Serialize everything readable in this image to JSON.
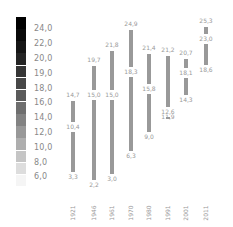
{
  "chart_data": {
    "type": "bar",
    "subtype": "floating-range",
    "title": "",
    "xlabel": "",
    "ylabel": "",
    "categories": [
      "1921",
      "1946",
      "1961",
      "1970",
      "1980",
      "1991",
      "2001",
      "2011"
    ],
    "series": [
      {
        "name": "top",
        "values": [
          14.7,
          19.7,
          21.8,
          24.9,
          21.4,
          21.2,
          20.7,
          25.3
        ]
      },
      {
        "name": "middle",
        "values": [
          10.4,
          15.0,
          15.0,
          18.3,
          15.8,
          12.6,
          18.1,
          23.0
        ]
      },
      {
        "name": "bottom",
        "values": [
          3.3,
          2.2,
          3.0,
          6.3,
          9.0,
          11.9,
          14.3,
          18.6
        ]
      }
    ],
    "labels": {
      "top": [
        "14,7",
        "19,7",
        "21,8",
        "24,9",
        "21,4",
        "21,2",
        "20,7",
        "25,3"
      ],
      "middle": [
        "10,4",
        "15,0",
        "15,0",
        "18,3",
        "15,8",
        "12,6",
        "18,1",
        "23,0"
      ],
      "bottom": [
        "3,3",
        "2,2",
        "3,0",
        "6,3",
        "9,0",
        "11,9",
        "14,3",
        "18,6"
      ]
    },
    "legend": {
      "type": "color-scale",
      "ticks": [
        "24,0",
        "22,0",
        "20,0",
        "19,0",
        "18,0",
        "16,0",
        "14,0",
        "12,0",
        "10,0",
        "8,0",
        "6,0"
      ],
      "from_color": "#000000",
      "to_color": "#ffffff"
    },
    "grid": false,
    "ylim": [
      0,
      26
    ]
  },
  "colors": {
    "bar": "#999999",
    "label": "#999999",
    "legend_tick": "#888888"
  }
}
